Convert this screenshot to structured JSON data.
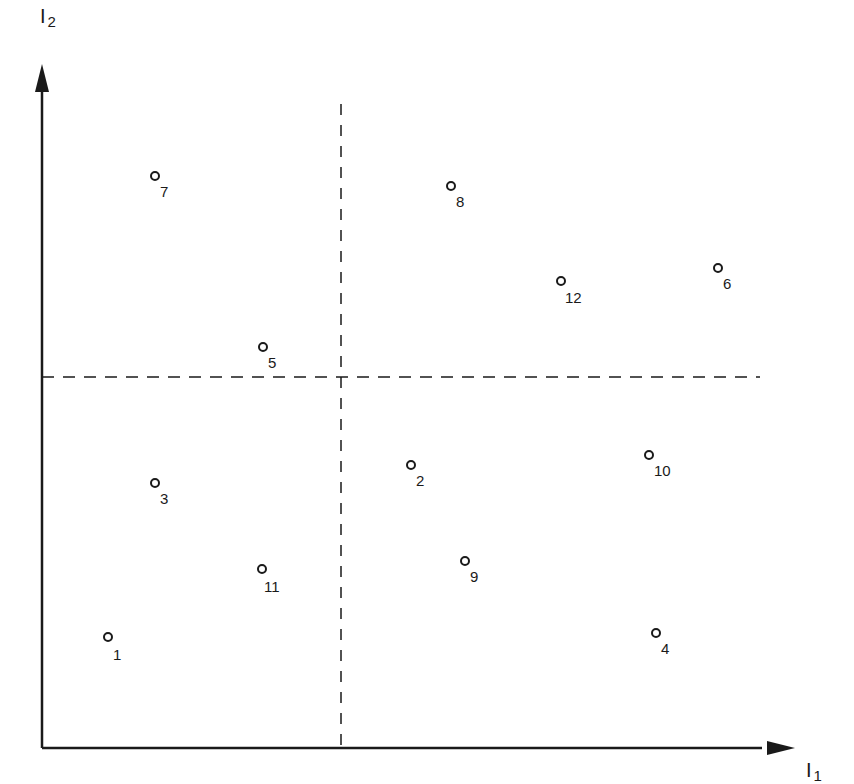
{
  "diagram": {
    "x_axis_label": "I",
    "x_axis_subscript": "1",
    "y_axis_label": "I",
    "y_axis_subscript": "2",
    "origin_px": [
      42,
      748
    ],
    "divider_vertical_x_px": 341,
    "divider_horizontal_y_px": 377,
    "line_color": "#1a1a1a"
  },
  "chart_data": {
    "type": "scatter",
    "title": "",
    "xlabel": "I1",
    "ylabel": "I2",
    "grid": false,
    "quadrant_dividers": {
      "vertical_dashed": true,
      "horizontal_dashed": true
    },
    "note": "Coordinates are relative positions: x from 0 (I2 axis) to 100 (right end of I1 axis); y from 0 (I1 axis) to 100 (top of I2 axis). Dashed dividers at x≈42, y≈57.",
    "points": [
      {
        "label": "1",
        "x": 9.3,
        "y": 16.8
      },
      {
        "label": "2",
        "x": 52.0,
        "y": 42.4
      },
      {
        "label": "3",
        "x": 15.9,
        "y": 39.7
      },
      {
        "label": "4",
        "x": 86.5,
        "y": 17.4
      },
      {
        "label": "5",
        "x": 31.0,
        "y": 60.3
      },
      {
        "label": "6",
        "x": 95.2,
        "y": 71.4
      },
      {
        "label": "7",
        "x": 15.9,
        "y": 85.4
      },
      {
        "label": "8",
        "x": 57.6,
        "y": 83.9
      },
      {
        "label": "9",
        "x": 59.5,
        "y": 28.0
      },
      {
        "label": "10",
        "x": 85.5,
        "y": 43.8
      },
      {
        "label": "11",
        "x": 30.9,
        "y": 26.8
      },
      {
        "label": "12",
        "x": 72.9,
        "y": 69.5
      }
    ],
    "points_px": [
      {
        "label": "1",
        "cx": 108,
        "cy": 637,
        "lx": 113,
        "ly": 647
      },
      {
        "label": "2",
        "cx": 411,
        "cy": 465,
        "lx": 416,
        "ly": 473
      },
      {
        "label": "3",
        "cx": 155,
        "cy": 483,
        "lx": 160,
        "ly": 491
      },
      {
        "label": "4",
        "cx": 656,
        "cy": 633,
        "lx": 661,
        "ly": 641
      },
      {
        "label": "5",
        "cx": 263,
        "cy": 347,
        "lx": 268,
        "ly": 355
      },
      {
        "label": "6",
        "cx": 718,
        "cy": 268,
        "lx": 723,
        "ly": 276
      },
      {
        "label": "7",
        "cx": 155,
        "cy": 176,
        "lx": 160,
        "ly": 184
      },
      {
        "label": "8",
        "cx": 451,
        "cy": 186,
        "lx": 456,
        "ly": 194
      },
      {
        "label": "9",
        "cx": 465,
        "cy": 561,
        "lx": 470,
        "ly": 569
      },
      {
        "label": "10",
        "cx": 649,
        "cy": 455,
        "lx": 654,
        "ly": 463
      },
      {
        "label": "11",
        "cx": 262,
        "cy": 569,
        "lx": 264,
        "ly": 579
      },
      {
        "label": "12",
        "cx": 561,
        "cy": 281,
        "lx": 565,
        "ly": 290
      }
    ]
  }
}
